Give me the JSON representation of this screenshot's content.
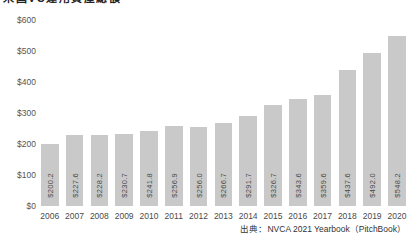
{
  "title": "米国VC運用資産総額",
  "source_note": "出典：NVCA 2021 Yearbook（PitchBook）",
  "colors": {
    "background": "#ffffff",
    "bar_fill": "#c9c9c9",
    "bar_value_label": "#4a4a4a",
    "axis_label": "#555555",
    "title_text": "#222222",
    "source_text": "#333333"
  },
  "chart_data": {
    "type": "bar",
    "title": "米国VC運用資産総額",
    "xlabel": "",
    "ylabel": "",
    "unit": "USD billions",
    "categories": [
      "2006",
      "2007",
      "2008",
      "2009",
      "2010",
      "2011",
      "2012",
      "2013",
      "2014",
      "2015",
      "2016",
      "2017",
      "2018",
      "2019",
      "2020"
    ],
    "values": [
      200.2,
      227.6,
      228.2,
      230.7,
      241.8,
      256.9,
      256.0,
      266.7,
      291.7,
      326.7,
      343.6,
      359.6,
      437.6,
      492.0,
      548.2
    ],
    "bar_labels": [
      "$200.2",
      "$227.6",
      "$228.2",
      "$230.7",
      "$241.8",
      "$256.9",
      "$256.0",
      "$266.7",
      "$291.7",
      "$326.7",
      "$343.6",
      "$359.6",
      "$437.6",
      "$492.0",
      "$548.2"
    ],
    "yticks": [
      {
        "label": "$0",
        "value": 0
      },
      {
        "label": "$100",
        "value": 100
      },
      {
        "label": "$200",
        "value": 200
      },
      {
        "label": "$300",
        "value": 300
      },
      {
        "label": "$400",
        "value": 400
      },
      {
        "label": "$500",
        "value": 500
      },
      {
        "label": "$600",
        "value": 600
      }
    ],
    "ylim": [
      0,
      600
    ],
    "grid": false,
    "legend": null,
    "source": "出典：NVCA 2021 Yearbook（PitchBook）"
  }
}
